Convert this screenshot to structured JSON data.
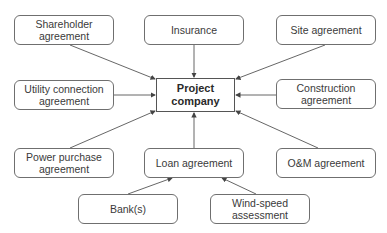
{
  "diagram": {
    "type": "hub-and-spoke",
    "center": {
      "id": "project",
      "label": "Project company"
    },
    "nodes": [
      {
        "id": "shareholder",
        "label": "Shareholder agreement",
        "x": 14,
        "y": 15,
        "w": 100,
        "h": 30
      },
      {
        "id": "insurance",
        "label": "Insurance",
        "x": 144,
        "y": 15,
        "w": 100,
        "h": 30
      },
      {
        "id": "site",
        "label": "Site agreement",
        "x": 276,
        "y": 15,
        "w": 100,
        "h": 30
      },
      {
        "id": "utility",
        "label": "Utility connection agreement",
        "x": 14,
        "y": 80,
        "w": 100,
        "h": 30
      },
      {
        "id": "construction",
        "label": "Construction agreement",
        "x": 276,
        "y": 79,
        "w": 100,
        "h": 30
      },
      {
        "id": "ppa",
        "label": "Power purchase agreement",
        "x": 14,
        "y": 148,
        "w": 100,
        "h": 30
      },
      {
        "id": "loan",
        "label": "Loan agreement",
        "x": 144,
        "y": 148,
        "w": 100,
        "h": 30
      },
      {
        "id": "om",
        "label": "O&M agreement",
        "x": 276,
        "y": 148,
        "w": 100,
        "h": 30
      },
      {
        "id": "bank",
        "label": "Bank(s)",
        "x": 78,
        "y": 194,
        "w": 100,
        "h": 30
      },
      {
        "id": "wind",
        "label": "Wind-speed assessment",
        "x": 210,
        "y": 194,
        "w": 100,
        "h": 30
      }
    ],
    "edges": [
      {
        "from": "shareholder",
        "to": "project"
      },
      {
        "from": "insurance",
        "to": "project"
      },
      {
        "from": "site",
        "to": "project"
      },
      {
        "from": "utility",
        "to": "project"
      },
      {
        "from": "construction",
        "to": "project"
      },
      {
        "from": "ppa",
        "to": "project"
      },
      {
        "from": "loan",
        "to": "project"
      },
      {
        "from": "om",
        "to": "project"
      },
      {
        "from": "bank",
        "to": "loan"
      },
      {
        "from": "wind",
        "to": "loan"
      }
    ],
    "colors": {
      "line": "#555555",
      "border": "#6f6f6f",
      "text": "#3a3a3a"
    }
  },
  "labels": {
    "shareholder": "Shareholder agreement",
    "insurance": "Insurance",
    "site": "Site agreement",
    "utility": "Utility connection agreement",
    "project": "Project company",
    "construction": "Construction agreement",
    "ppa": "Power purchase agreement",
    "loan": "Loan agreement",
    "om": "O&M agreement",
    "bank": "Bank(s)",
    "wind": "Wind-speed assessment"
  }
}
